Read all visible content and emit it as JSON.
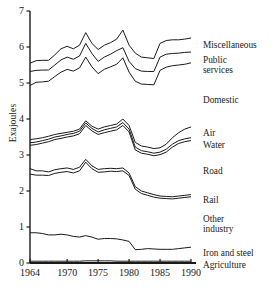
{
  "chart_data": {
    "type": "line",
    "title": "",
    "xlabel": "",
    "ylabel": "Exajoules",
    "xlim": [
      1964,
      1990
    ],
    "ylim": [
      0,
      7
    ],
    "yticks": [
      0,
      1,
      2,
      3,
      4,
      5,
      6,
      7
    ],
    "ytick_labels": [
      "0",
      "1",
      "2",
      "3",
      "4",
      "5",
      "6",
      "7"
    ],
    "xticks": [
      1964,
      1970,
      1975,
      1980,
      1985,
      1990
    ],
    "xtick_labels": [
      "1964",
      "1970",
      "1975",
      "1980",
      "1985",
      "1990"
    ],
    "grid": false,
    "legend": "right-inline-labels",
    "note": "Cumulative boundary lines; each labelled band is the gap beneath its label line.",
    "x": [
      1964,
      1965,
      1966,
      1967,
      1968,
      1969,
      1970,
      1971,
      1972,
      1973,
      1974,
      1975,
      1976,
      1977,
      1978,
      1979,
      1980,
      1981,
      1982,
      1983,
      1984,
      1985,
      1986,
      1987,
      1988,
      1989,
      1990
    ],
    "series": [
      {
        "name": "Miscellaneous",
        "values": [
          5.55,
          5.62,
          5.63,
          5.63,
          5.78,
          5.95,
          6.02,
          5.95,
          6.05,
          6.4,
          6.1,
          5.93,
          6.05,
          6.12,
          6.22,
          6.47,
          6.05,
          5.83,
          5.72,
          5.7,
          5.68,
          6.1,
          6.18,
          6.2,
          6.2,
          6.22,
          6.25
        ]
      },
      {
        "name": "Public services",
        "values": [
          5.32,
          5.35,
          5.36,
          5.36,
          5.5,
          5.64,
          5.72,
          5.66,
          5.75,
          6.1,
          5.82,
          5.6,
          5.72,
          5.8,
          5.9,
          5.98,
          5.6,
          5.4,
          5.33,
          5.32,
          5.32,
          5.72,
          5.8,
          5.82,
          5.83,
          5.85,
          5.86
        ]
      },
      {
        "name": "Domestic",
        "values": [
          4.93,
          5.02,
          5.03,
          5.05,
          5.18,
          5.3,
          5.38,
          5.33,
          5.42,
          5.72,
          5.45,
          5.26,
          5.38,
          5.45,
          5.52,
          5.7,
          5.3,
          5.05,
          4.97,
          4.96,
          4.95,
          5.35,
          5.44,
          5.48,
          5.5,
          5.52,
          5.56
        ]
      },
      {
        "name": "Air",
        "values": [
          3.43,
          3.45,
          3.48,
          3.52,
          3.57,
          3.6,
          3.63,
          3.66,
          3.72,
          3.95,
          3.8,
          3.72,
          3.78,
          3.82,
          3.86,
          4.0,
          3.82,
          3.35,
          3.25,
          3.22,
          3.18,
          3.2,
          3.3,
          3.48,
          3.62,
          3.72,
          3.78
        ]
      },
      {
        "name": "Water",
        "values": [
          3.34,
          3.36,
          3.4,
          3.44,
          3.5,
          3.53,
          3.57,
          3.6,
          3.66,
          3.89,
          3.74,
          3.64,
          3.7,
          3.74,
          3.78,
          3.9,
          3.72,
          3.22,
          3.12,
          3.09,
          3.05,
          3.08,
          3.16,
          3.3,
          3.4,
          3.45,
          3.48
        ]
      },
      {
        "name": "Road",
        "values": [
          3.27,
          3.29,
          3.33,
          3.37,
          3.43,
          3.46,
          3.5,
          3.53,
          3.59,
          3.82,
          3.67,
          3.57,
          3.62,
          3.66,
          3.7,
          3.82,
          3.64,
          3.14,
          3.05,
          3.02,
          2.98,
          3.01,
          3.08,
          3.22,
          3.32,
          3.37,
          3.4
        ]
      },
      {
        "name": "Rail",
        "values": [
          2.62,
          2.56,
          2.56,
          2.53,
          2.59,
          2.62,
          2.64,
          2.6,
          2.66,
          2.88,
          2.7,
          2.6,
          2.62,
          2.63,
          2.62,
          2.64,
          2.5,
          2.12,
          2.0,
          1.95,
          1.9,
          1.86,
          1.85,
          1.84,
          1.86,
          1.88,
          1.9
        ]
      },
      {
        "name": "Other industry",
        "values": [
          2.47,
          2.44,
          2.44,
          2.43,
          2.49,
          2.52,
          2.54,
          2.5,
          2.56,
          2.8,
          2.62,
          2.52,
          2.53,
          2.55,
          2.54,
          2.56,
          2.43,
          2.05,
          1.93,
          1.88,
          1.83,
          1.8,
          1.79,
          1.78,
          1.8,
          1.82,
          1.84
        ]
      },
      {
        "name": "Iron and steel",
        "values": [
          0.84,
          0.84,
          0.82,
          0.78,
          0.78,
          0.8,
          0.78,
          0.74,
          0.72,
          0.76,
          0.72,
          0.66,
          0.68,
          0.68,
          0.67,
          0.64,
          0.6,
          0.37,
          0.38,
          0.4,
          0.39,
          0.38,
          0.38,
          0.38,
          0.4,
          0.42,
          0.44
        ]
      },
      {
        "name": "Agriculture",
        "values": [
          0.05,
          0.05,
          0.05,
          0.05,
          0.05,
          0.05,
          0.05,
          0.05,
          0.05,
          0.06,
          0.06,
          0.06,
          0.06,
          0.06,
          0.05,
          0.05,
          0.05,
          0.05,
          0.05,
          0.05,
          0.05,
          0.05,
          0.05,
          0.05,
          0.05,
          0.05,
          0.05
        ]
      }
    ],
    "annotations": [
      {
        "text": "Miscellaneous",
        "at_series": "Miscellaneous"
      },
      {
        "text": "Public",
        "at_series": "Public services"
      },
      {
        "text": "services",
        "at_series": "Public services"
      },
      {
        "text": "Domestic",
        "at_series": "Domestic"
      },
      {
        "text": "Air",
        "at_series": "Air"
      },
      {
        "text": "Water",
        "at_series": "Water"
      },
      {
        "text": "Road",
        "at_series": "Road"
      },
      {
        "text": "Rail",
        "at_series": "Rail"
      },
      {
        "text": "Other",
        "at_series": "Other industry"
      },
      {
        "text": "industry",
        "at_series": "Other industry"
      },
      {
        "text": "Iron and steel",
        "at_series": "Iron and steel"
      },
      {
        "text": "Agriculture",
        "at_series": "Agriculture"
      }
    ]
  },
  "axis": {
    "ylabel": "Exajoules",
    "yticks": [
      "7",
      "6",
      "5",
      "4",
      "3",
      "2",
      "1",
      "0"
    ],
    "xticks": [
      "1964",
      "1970",
      "1975",
      "1980",
      "1985",
      "1990"
    ]
  },
  "labels": {
    "miscellaneous": "Miscellaneous",
    "public": "Public",
    "services": "services",
    "domestic": "Domestic",
    "air": "Air",
    "water": "Water",
    "road": "Road",
    "rail": "Rail",
    "other": "Other",
    "industry": "industry",
    "iron_and_steel": "Iron and steel",
    "agriculture": "Agriculture"
  },
  "colors": {
    "line": "#1a1a1a",
    "axis": "#1a1a1a",
    "background": "#ffffff"
  }
}
